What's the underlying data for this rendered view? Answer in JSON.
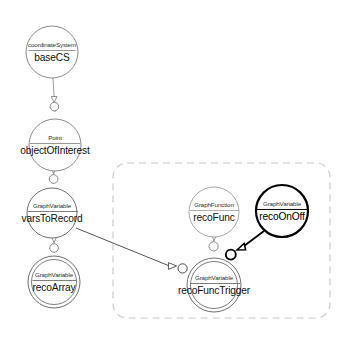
{
  "diagram": {
    "background_color": "#ffffff",
    "group_box": {
      "name": "reconstruction-group",
      "style": "dashed",
      "color": "#c9c9c9",
      "x": 113,
      "y": 163,
      "width": 217,
      "height": 155,
      "corner_radius": 14
    },
    "nodes": [
      {
        "id": "baseCS",
        "type_label": "coordinateSystem",
        "name_label": "baseCS",
        "cx": 52,
        "cy": 52,
        "r": 26,
        "style": "single",
        "stroke": "#8c8c8c",
        "stroke_width": 1
      },
      {
        "id": "objectOfInterest",
        "type_label": "Point",
        "name_label": "objectOfInterest",
        "cx": 55,
        "cy": 145,
        "r": 26,
        "style": "single",
        "stroke": "#8c8c8c",
        "stroke_width": 1
      },
      {
        "id": "varsToRecord",
        "type_label": "GraphVariable",
        "name_label": "varsToRecord",
        "cx": 52,
        "cy": 213,
        "r": 25,
        "style": "single",
        "stroke": "#6f6f6f",
        "stroke_width": 1
      },
      {
        "id": "recoArray",
        "type_label": "GraphVariable",
        "name_label": "recoArray",
        "cx": 54,
        "cy": 282,
        "r": 26,
        "style": "double",
        "stroke": "#6f6f6f",
        "stroke_width": 1
      },
      {
        "id": "recoFunc",
        "type_label": "GraphFunction",
        "name_label": "recoFunc",
        "cx": 214,
        "cy": 212,
        "r": 25,
        "style": "single",
        "stroke": "#a8a8a8",
        "stroke_width": 1
      },
      {
        "id": "recoOnOff",
        "type_label": "GraphVariable",
        "name_label": "recoOnOff",
        "cx": 282,
        "cy": 211,
        "r": 26,
        "style": "bold",
        "stroke": "#000000",
        "stroke_width": 2.2
      },
      {
        "id": "recoFuncTrigger",
        "type_label": "GraphVariable",
        "name_label": "recoFuncTrigger",
        "cx": 214,
        "cy": 285,
        "r": 27,
        "style": "double",
        "stroke": "#6f6f6f",
        "stroke_width": 1
      }
    ],
    "edges": [
      {
        "id": "baseCS-to-objectOfInterest",
        "from": "baseCS",
        "to": "objectOfInterest",
        "style": "thin",
        "color": "#8a8a8a",
        "socket": "circle-arrow"
      },
      {
        "id": "objectOfInterest-to-varsToRecord",
        "from": "objectOfInterest",
        "to": "varsToRecord",
        "style": "thin",
        "color": "#8a8a8a",
        "socket": "circle-arrow"
      },
      {
        "id": "varsToRecord-to-recoArray",
        "from": "varsToRecord",
        "to": "recoArray",
        "style": "thin",
        "color": "#8a8a8a",
        "socket": "circle-arrow"
      },
      {
        "id": "varsToRecord-to-recoFuncTrigger",
        "from": "varsToRecord",
        "to": "recoFuncTrigger",
        "style": "thin",
        "color": "#555555",
        "socket": "circle-arrow"
      },
      {
        "id": "recoFunc-to-recoFuncTrigger",
        "from": "recoFunc",
        "to": "recoFuncTrigger",
        "style": "thin",
        "color": "#8a8a8a",
        "socket": "circle-arrow"
      },
      {
        "id": "recoOnOff-to-recoFuncTrigger",
        "from": "recoOnOff",
        "to": "recoFuncTrigger",
        "style": "bold",
        "color": "#000000",
        "socket": "circle-arrow"
      }
    ]
  }
}
